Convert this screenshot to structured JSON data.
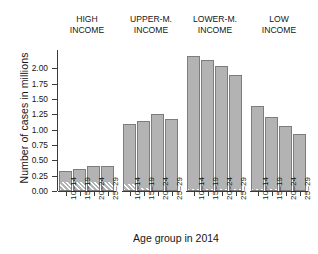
{
  "chart_data": {
    "type": "bar",
    "title": "",
    "xlabel": "Age group in 2014",
    "ylabel": "Number of cases in millions",
    "ylim": [
      0,
      2.3
    ],
    "yticks": [
      0.0,
      0.25,
      0.5,
      0.75,
      1.0,
      1.25,
      1.5,
      1.75,
      2.0
    ],
    "ytick_labels": [
      "0.00",
      "0.25",
      "0.50",
      "0.75",
      "1.00",
      "1.25",
      "1.50",
      "1.75",
      "2.00"
    ],
    "grid": false,
    "legend": "none",
    "categories": [
      "10–14",
      "15–19",
      "20–24",
      "25–29"
    ],
    "panels": [
      {
        "name": "high-income",
        "title_line1": "HIGH",
        "title_line2": "INCOME",
        "values": [
          0.33,
          0.36,
          0.4,
          0.41
        ],
        "hatched_base": [
          0.13,
          0.13,
          0.13,
          0.13
        ]
      },
      {
        "name": "upper-middle-income",
        "title_line1": "UPPER-M.",
        "title_line2": "INCOME",
        "values": [
          1.09,
          1.15,
          1.25,
          1.17
        ],
        "hatched_base": [
          0.1,
          0.04,
          0.0,
          0.0
        ]
      },
      {
        "name": "lower-middle-income",
        "title_line1": "LOWER-M.",
        "title_line2": "INCOME",
        "values": [
          2.2,
          2.13,
          2.04,
          1.9
        ],
        "hatched_base": [
          0.02,
          0.02,
          0.02,
          0.02
        ]
      },
      {
        "name": "low-income",
        "title_line1": "LOW",
        "title_line2": "INCOME",
        "values": [
          1.38,
          1.2,
          1.06,
          0.93
        ],
        "hatched_base": [
          0.02,
          0.02,
          0.0,
          0.0
        ]
      }
    ],
    "colors": {
      "bar_fill": "#b3b3b3",
      "bar_border": "#7d7d7d",
      "axis": "#3b3b3b",
      "text": "#161616",
      "background": "#ffffff"
    }
  }
}
